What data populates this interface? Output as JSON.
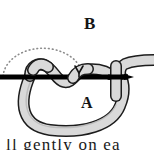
{
  "figure": {
    "title_label": "B",
    "inner_label": "A",
    "caption_partial": "ll gently on ea",
    "colors": {
      "background": "#ffffff",
      "rope_fill": "#d9d9d9",
      "rope_fill_shadow": "#bdbdbd",
      "rope_outline": "#1c1c1c",
      "needle": "#000000",
      "dotted_arc": "#7a7a7a",
      "label_text": "#141414"
    },
    "elements": {
      "needle_name": "straight-needle",
      "rope_name": "rope-strand",
      "loop_name": "hanging-loop",
      "arc_name": "dotted-arc-guide",
      "marker_name": "down-arrow-marker"
    }
  }
}
